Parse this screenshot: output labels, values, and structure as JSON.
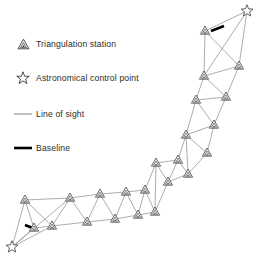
{
  "figure": {
    "background": "#ffffff"
  },
  "legend": {
    "items": [
      {
        "symbol": "triangulation-station-icon",
        "label": "Triangulation station"
      },
      {
        "symbol": "astronomical-control-point-icon",
        "label": "Astronomical control point"
      },
      {
        "symbol": "line-of-sight-icon",
        "label": "Line of sight"
      },
      {
        "symbol": "baseline-icon",
        "label": "Baseline"
      }
    ]
  },
  "colors": {
    "line_of_sight": "#8a8a8a",
    "baseline": "#000000",
    "station_stroke": "#3a3a3a",
    "station_fill": "#ffffff",
    "text": "#2b2b2b"
  },
  "chart_data": {
    "type": "diagram",
    "subtype": "survey-triangulation-chain",
    "stations": [
      {
        "id": "S1",
        "x": 25,
        "y": 200,
        "type": "triangulation station"
      },
      {
        "id": "S2",
        "x": 34,
        "y": 228,
        "type": "triangulation station"
      },
      {
        "id": "S3",
        "x": 52,
        "y": 226,
        "type": "triangulation station"
      },
      {
        "id": "S4",
        "x": 70,
        "y": 198,
        "type": "triangulation station"
      },
      {
        "id": "S5",
        "x": 87,
        "y": 222,
        "type": "triangulation station"
      },
      {
        "id": "S6",
        "x": 100,
        "y": 194,
        "type": "triangulation station"
      },
      {
        "id": "S7",
        "x": 115,
        "y": 219,
        "type": "triangulation station"
      },
      {
        "id": "S8",
        "x": 126,
        "y": 192,
        "type": "triangulation station"
      },
      {
        "id": "S9",
        "x": 138,
        "y": 215,
        "type": "triangulation station"
      },
      {
        "id": "S10",
        "x": 145,
        "y": 190,
        "type": "triangulation station"
      },
      {
        "id": "S11",
        "x": 155,
        "y": 212,
        "type": "triangulation station"
      },
      {
        "id": "S12",
        "x": 156,
        "y": 163,
        "type": "triangulation station"
      },
      {
        "id": "S13",
        "x": 168,
        "y": 182,
        "type": "triangulation station"
      },
      {
        "id": "S14",
        "x": 178,
        "y": 160,
        "type": "triangulation station"
      },
      {
        "id": "S15",
        "x": 188,
        "y": 174,
        "type": "triangulation station"
      },
      {
        "id": "S16",
        "x": 207,
        "y": 153,
        "type": "triangulation station"
      },
      {
        "id": "S17",
        "x": 186,
        "y": 135,
        "type": "triangulation station"
      },
      {
        "id": "S18",
        "x": 214,
        "y": 125,
        "type": "triangulation station"
      },
      {
        "id": "S19",
        "x": 196,
        "y": 100,
        "type": "triangulation station"
      },
      {
        "id": "S20",
        "x": 226,
        "y": 97,
        "type": "triangulation station"
      },
      {
        "id": "S21",
        "x": 204,
        "y": 76,
        "type": "triangulation station"
      },
      {
        "id": "S22",
        "x": 239,
        "y": 66,
        "type": "triangulation station"
      },
      {
        "id": "S23",
        "x": 205,
        "y": 31,
        "type": "triangulation station"
      }
    ],
    "control_points": [
      {
        "id": "A1",
        "x": 12,
        "y": 247,
        "type": "astronomical control point"
      },
      {
        "id": "A2",
        "x": 247,
        "y": 11,
        "type": "astronomical control point"
      }
    ],
    "lines_of_sight": [
      [
        "A1",
        "S1"
      ],
      [
        "A1",
        "S2"
      ],
      [
        "A1",
        "S3"
      ],
      [
        "A1",
        "S4"
      ],
      [
        "S1",
        "S2"
      ],
      [
        "S1",
        "S3"
      ],
      [
        "S1",
        "S4"
      ],
      [
        "S2",
        "S3"
      ],
      [
        "S3",
        "S4"
      ],
      [
        "S3",
        "S5"
      ],
      [
        "S4",
        "S5"
      ],
      [
        "S4",
        "S6"
      ],
      [
        "S5",
        "S6"
      ],
      [
        "S5",
        "S7"
      ],
      [
        "S6",
        "S7"
      ],
      [
        "S6",
        "S8"
      ],
      [
        "S7",
        "S8"
      ],
      [
        "S7",
        "S9"
      ],
      [
        "S8",
        "S9"
      ],
      [
        "S8",
        "S10"
      ],
      [
        "S9",
        "S10"
      ],
      [
        "S9",
        "S11"
      ],
      [
        "S10",
        "S11"
      ],
      [
        "S10",
        "S12"
      ],
      [
        "S11",
        "S12"
      ],
      [
        "S11",
        "S13"
      ],
      [
        "S12",
        "S13"
      ],
      [
        "S12",
        "S14"
      ],
      [
        "S13",
        "S14"
      ],
      [
        "S13",
        "S15"
      ],
      [
        "S14",
        "S15"
      ],
      [
        "S14",
        "S17"
      ],
      [
        "S15",
        "S16"
      ],
      [
        "S15",
        "S17"
      ],
      [
        "S16",
        "S17"
      ],
      [
        "S16",
        "S18"
      ],
      [
        "S17",
        "S18"
      ],
      [
        "S17",
        "S19"
      ],
      [
        "S18",
        "S19"
      ],
      [
        "S18",
        "S20"
      ],
      [
        "S19",
        "S20"
      ],
      [
        "S19",
        "S21"
      ],
      [
        "S20",
        "S21"
      ],
      [
        "S20",
        "S22"
      ],
      [
        "S21",
        "S22"
      ],
      [
        "S21",
        "S23"
      ],
      [
        "S22",
        "S23"
      ],
      [
        "S23",
        "A2"
      ],
      [
        "S22",
        "A2"
      ],
      [
        "S21",
        "A2"
      ]
    ],
    "baselines": [
      {
        "from": [
          25,
          225
        ],
        "to": [
          35,
          229
        ],
        "label": "Baseline"
      },
      {
        "from": [
          211,
          31
        ],
        "to": [
          224,
          26
        ],
        "label": "Baseline"
      }
    ]
  }
}
